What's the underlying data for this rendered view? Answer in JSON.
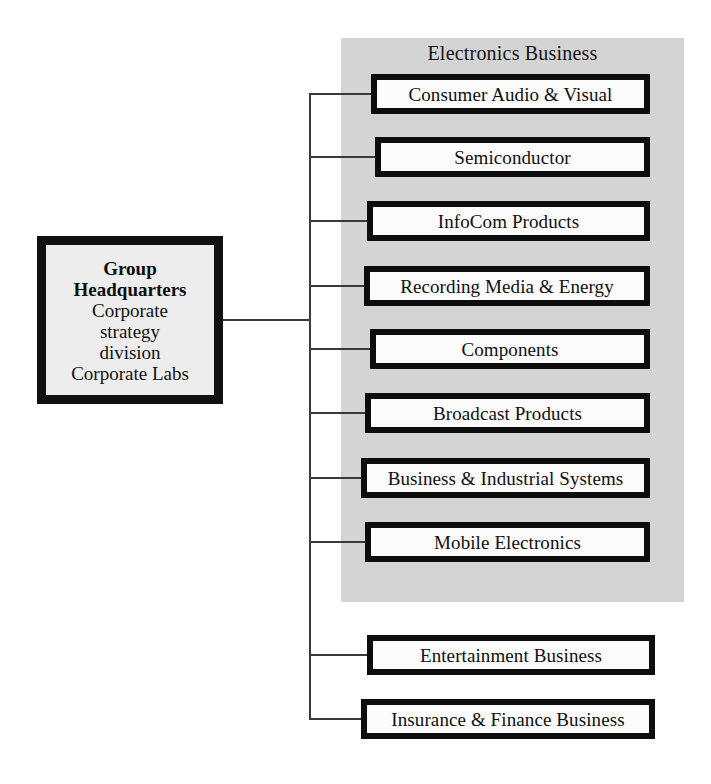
{
  "diagram": {
    "headquarters": {
      "name": "Group Headquarters",
      "title_lines": [
        "Group",
        "Headquarters"
      ],
      "detail_lines": [
        "Corporate",
        "strategy",
        "division",
        "Corporate Labs"
      ]
    },
    "division_panel": {
      "title": "Electronics Business",
      "units": [
        {
          "label": "Consumer Audio & Visual"
        },
        {
          "label": "Semiconductor"
        },
        {
          "label": "InfoCom Products"
        },
        {
          "label": "Recording Media & Energy"
        },
        {
          "label": "Components"
        },
        {
          "label": "Broadcast Products"
        },
        {
          "label": "Business & Industrial Systems"
        },
        {
          "label": "Mobile Electronics"
        }
      ]
    },
    "other_units": [
      {
        "label": "Entertainment Business"
      },
      {
        "label": "Insurance & Finance Business"
      }
    ],
    "colors": {
      "panel_background": "#d4d4d4",
      "box_border": "#0d0d0d",
      "box_fill": "#fbfbfb",
      "box_shadow": "#a8a8a8",
      "connector": "#3a3a3a",
      "page_background": "#ffffff"
    }
  }
}
